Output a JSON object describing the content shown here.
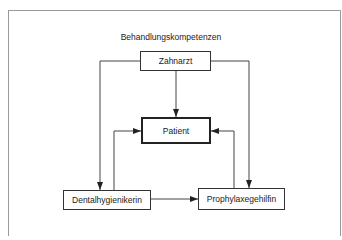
{
  "diagram": {
    "title": "Behandlungskompetenzen",
    "nodes": {
      "zahnarzt": "Zahnarzt",
      "patient": "Patient",
      "dentalhygienikerin": "Dentalhygienikerin",
      "prophylaxegehilfin": "Prophylaxegehilfin"
    },
    "edges": [
      {
        "from": "Zahnarzt",
        "to": "Patient"
      },
      {
        "from": "Zahnarzt",
        "to": "Dentalhygienikerin"
      },
      {
        "from": "Zahnarzt",
        "to": "Prophylaxegehilfin"
      },
      {
        "from": "Dentalhygienikerin",
        "to": "Patient"
      },
      {
        "from": "Prophylaxegehilfin",
        "to": "Patient"
      },
      {
        "from": "Dentalhygienikerin",
        "to": "Prophylaxegehilfin"
      }
    ],
    "colors": {
      "line": "#333333",
      "frame": "#9a9a9a"
    }
  }
}
